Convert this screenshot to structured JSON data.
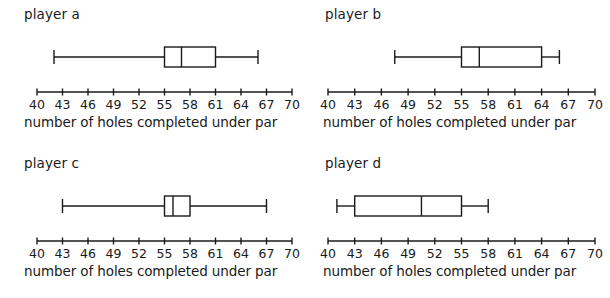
{
  "figure": {
    "panel_count": 4,
    "axis_caption": "number of holes completed under par"
  },
  "chart_data": {
    "type": "box",
    "title": "",
    "xlabel": "number of holes completed under par",
    "ylabel": "",
    "xlim": [
      40,
      70
    ],
    "xticks": [
      40,
      43,
      46,
      49,
      52,
      55,
      58,
      61,
      64,
      67,
      70
    ],
    "xticklabels": [
      "40",
      "43",
      "46",
      "49",
      "52",
      "55",
      "58",
      "61",
      "64",
      "67",
      "70"
    ],
    "grid": false,
    "legend": false,
    "panels": [
      {
        "label": "player a",
        "caption": "number of holes completed under par",
        "min": 42,
        "q1": 55,
        "median": 57,
        "q3": 61,
        "max": 66
      },
      {
        "label": "player b",
        "caption": "number of holes completed under par",
        "min": 47.5,
        "q1": 55,
        "median": 57,
        "q3": 64,
        "max": 66
      },
      {
        "label": "player c",
        "caption": "number of holes completed under par",
        "min": 43,
        "q1": 55,
        "median": 56,
        "q3": 58,
        "max": 67
      },
      {
        "label": "player d",
        "caption": "number of holes completed under par",
        "min": 41,
        "q1": 43,
        "median": 50.5,
        "q3": 55,
        "max": 58
      }
    ]
  }
}
